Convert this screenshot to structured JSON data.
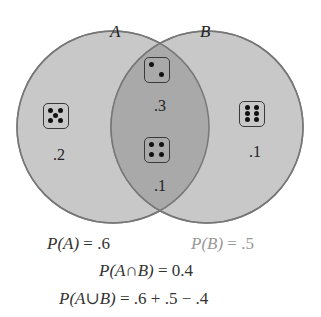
{
  "diagram": {
    "type": "venn",
    "sets": [
      {
        "name": "A",
        "label": "A"
      },
      {
        "name": "B",
        "label": "B"
      }
    ],
    "colors": {
      "region_outer": "#c8c8c8",
      "region_intersection": "#a9a9a9",
      "outline": "#777777"
    },
    "regions": {
      "a_only": {
        "die_face": 5,
        "probability": ".2"
      },
      "intersection_top": {
        "die_face": 2,
        "probability": ".3"
      },
      "intersection_bottom": {
        "die_face": 4,
        "probability": ".1"
      },
      "b_only": {
        "die_face": 6,
        "probability": ".1"
      }
    }
  },
  "formulas": {
    "pa_lhs": "P(A)",
    "pa_rhs": " = .6",
    "pb_lhs": "P(B)",
    "pb_rhs": " = .5",
    "pab_int_lhs": "P(A∩B)",
    "pab_int_rhs": " = 0.4",
    "pab_union_lhs": "P(A∪B)",
    "pab_union_rhs": " = .6 + .5 − .4"
  }
}
